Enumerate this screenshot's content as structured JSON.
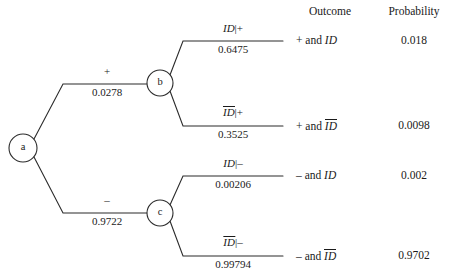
{
  "diagram": {
    "type": "probability-tree",
    "columns": {
      "outcome_header": "Outcome",
      "probability_header": "Probability"
    },
    "nodes": [
      {
        "id": "a",
        "label": "a",
        "cx": 23,
        "cy": 148,
        "r": 14
      },
      {
        "id": "b",
        "label": "b",
        "cx": 160,
        "cy": 83,
        "r": 13
      },
      {
        "id": "c",
        "label": "c",
        "cx": 160,
        "cy": 213,
        "r": 13
      }
    ],
    "level1_branches": [
      {
        "from": "a",
        "to": "b",
        "sign": "+",
        "probability": "0.0278"
      },
      {
        "from": "a",
        "to": "c",
        "sign": "–",
        "probability": "0.9722"
      }
    ],
    "level2_branches": [
      {
        "from": "b",
        "event": "ID",
        "event_bar": false,
        "given": "+",
        "label": "ID|+",
        "probability": "0.6475"
      },
      {
        "from": "b",
        "event": "ID",
        "event_bar": true,
        "given": "+",
        "label": "ID̅|+",
        "probability": "0.3525"
      },
      {
        "from": "c",
        "event": "ID",
        "event_bar": false,
        "given": "–",
        "label": "ID|–",
        "probability": "0.00206"
      },
      {
        "from": "c",
        "event": "ID",
        "event_bar": true,
        "given": "–",
        "label": "ID̅|–",
        "probability": "0.99794"
      }
    ],
    "rows": [
      {
        "outcome_prefix": "+ and",
        "outcome_event": "ID",
        "outcome_bar": false,
        "probability": "0.018"
      },
      {
        "outcome_prefix": "+ and",
        "outcome_event": "ID",
        "outcome_bar": true,
        "probability": "0.0098"
      },
      {
        "outcome_prefix": "– and",
        "outcome_event": "ID",
        "outcome_bar": false,
        "probability": "0.002"
      },
      {
        "outcome_prefix": "– and",
        "outcome_event": "ID",
        "outcome_bar": true,
        "probability": "0.9702"
      }
    ],
    "colors": {
      "line": "#2b2b2b",
      "text": "#1a1a1a",
      "background": "#ffffff"
    }
  }
}
